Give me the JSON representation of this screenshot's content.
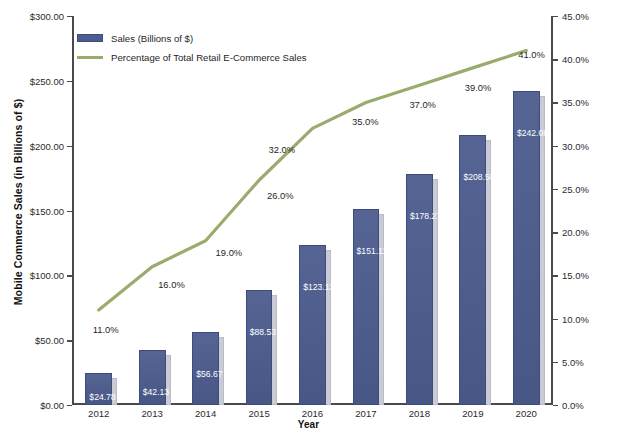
{
  "chart_data": {
    "type": "bar",
    "title": "",
    "xlabel": "Year",
    "categories": [
      "2012",
      "2013",
      "2014",
      "2015",
      "2016",
      "2017",
      "2018",
      "2019",
      "2020"
    ],
    "series": [
      {
        "name": "Sales (Billions of $)",
        "axis": "left",
        "type": "bar",
        "color": "#4c5c8e",
        "values": [
          24.78,
          42.13,
          56.67,
          88.53,
          123.13,
          151.11,
          178.27,
          208.58,
          242.08
        ],
        "data_labels": [
          "$24.78",
          "$42.13",
          "$56.67",
          "$88.53",
          "$123.13",
          "$151.11",
          "$178.27",
          "$208.58",
          "$242.08"
        ]
      },
      {
        "name": "Percentage of Total Retail E-Commerce Sales",
        "axis": "right",
        "type": "line",
        "color": "#9aab6e",
        "values": [
          11.0,
          16.0,
          19.0,
          26.0,
          32.0,
          35.0,
          37.0,
          39.0,
          41.0
        ],
        "data_labels": [
          "11.0%",
          "16.0%",
          "19.0%",
          "26.0%",
          "32.0%",
          "35.0%",
          "37.0%",
          "39.0%",
          "41.0%"
        ]
      }
    ],
    "y_left": {
      "label": "Mobile Commerce Sales (in Billions of $)",
      "ylim": [
        0,
        300
      ],
      "ticks": [
        0,
        50,
        100,
        150,
        200,
        250,
        300
      ],
      "tick_labels": [
        "$0.00",
        "$50.00",
        "$100.00",
        "$150.00",
        "$200.00",
        "$250.00",
        "$300.00"
      ]
    },
    "y_right": {
      "label": "Mobile Commerce Sales as a Percentage of Total Retail E-Commerce Sales",
      "ylim": [
        0,
        45
      ],
      "ticks": [
        0,
        5,
        10,
        15,
        20,
        25,
        30,
        35,
        40,
        45
      ],
      "tick_labels": [
        "0.0%",
        "5.0%",
        "10.0%",
        "15.0%",
        "20.0%",
        "25.0%",
        "30.0%",
        "35.0%",
        "40.0%",
        "45.0%"
      ]
    },
    "grid": false,
    "legend_position": "top-left",
    "legend": [
      {
        "label": "Sales (Billions of $)",
        "marker": "bar",
        "color": "#4c5c8e"
      },
      {
        "label": "Percentage of Total Retail E-Commerce Sales",
        "marker": "line",
        "color": "#9aab6e"
      }
    ]
  }
}
